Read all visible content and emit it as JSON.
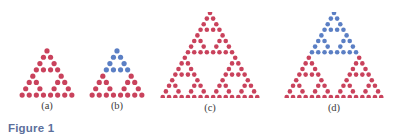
{
  "figure": {
    "caption": "Figure 1",
    "caption_color": "#5c6f9c",
    "background": "#ffffff"
  },
  "colors": {
    "red": "#c9425c",
    "blue": "#5b7fc4"
  },
  "panels": [
    {
      "id": "panel-a",
      "label": "(a)",
      "order": 2,
      "rows": 8,
      "bottom_row_dots": 8,
      "total_dots": 27,
      "dot_color": "#c9425c",
      "blue_rows": 0,
      "left": 16,
      "top": 48,
      "width": 62,
      "height": 50,
      "dot_size": 5.2,
      "spacing_x": 7.1,
      "spacing_y": 6.3,
      "label_top": 100
    },
    {
      "id": "panel-b",
      "label": "(b)",
      "order": 2,
      "rows": 8,
      "bottom_row_dots": 8,
      "total_dots": 27,
      "dot_color": "#c9425c",
      "blue_rows": 4,
      "blue_dots": 9,
      "red_dots": 18,
      "left": 86,
      "top": 48,
      "width": 62,
      "height": 50,
      "dot_size": 5.2,
      "spacing_x": 7.1,
      "spacing_y": 6.3,
      "label_top": 100
    },
    {
      "id": "panel-c",
      "label": "(c)",
      "order": 3,
      "rows": 16,
      "bottom_row_dots": 16,
      "total_dots": 81,
      "dot_color": "#c9425c",
      "blue_rows": 0,
      "left": 158,
      "top": 12,
      "width": 104,
      "height": 86,
      "dot_size": 4.6,
      "spacing_x": 6.3,
      "spacing_y": 5.6,
      "label_top": 102
    },
    {
      "id": "panel-d",
      "label": "(d)",
      "order": 3,
      "rows": 16,
      "bottom_row_dots": 16,
      "total_dots": 81,
      "dot_color": "#c9425c",
      "blue_rows": 8,
      "blue_dots": 27,
      "red_dots": 54,
      "left": 282,
      "top": 12,
      "width": 104,
      "height": 86,
      "dot_size": 4.6,
      "spacing_x": 6.3,
      "spacing_y": 5.6,
      "label_top": 102
    }
  ]
}
